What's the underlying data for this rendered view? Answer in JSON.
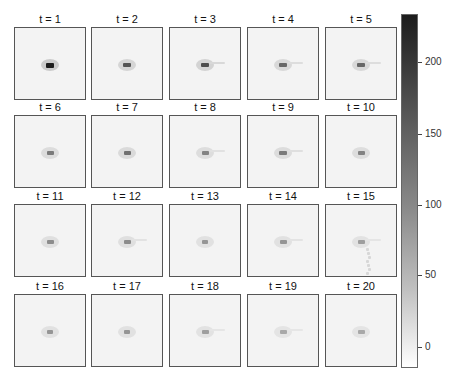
{
  "chart_data": {
    "type": "heatmap",
    "title": "",
    "layout": {
      "rows": 4,
      "cols": 5
    },
    "panels": [
      {
        "title": "t = 1",
        "peak": 230,
        "blob": {
          "cx": 35,
          "cy": 37,
          "w": 8,
          "h": 5
        },
        "trail": false
      },
      {
        "title": "t = 2",
        "peak": 170,
        "blob": {
          "cx": 35,
          "cy": 37,
          "w": 8,
          "h": 4
        },
        "trail": false
      },
      {
        "title": "t = 3",
        "peak": 180,
        "blob": {
          "cx": 35,
          "cy": 37,
          "w": 8,
          "h": 4
        },
        "trail": true
      },
      {
        "title": "t = 4",
        "peak": 150,
        "blob": {
          "cx": 35,
          "cy": 37,
          "w": 8,
          "h": 4
        },
        "trail": true
      },
      {
        "title": "t = 5",
        "peak": 150,
        "blob": {
          "cx": 35,
          "cy": 37,
          "w": 8,
          "h": 4
        },
        "trail": true
      },
      {
        "title": "t = 6",
        "peak": 130,
        "blob": {
          "cx": 35,
          "cy": 37,
          "w": 7,
          "h": 4
        },
        "trail": false
      },
      {
        "title": "t = 7",
        "peak": 140,
        "blob": {
          "cx": 35,
          "cy": 37,
          "w": 7,
          "h": 4
        },
        "trail": false
      },
      {
        "title": "t = 8",
        "peak": 120,
        "blob": {
          "cx": 35,
          "cy": 37,
          "w": 7,
          "h": 4
        },
        "trail": true
      },
      {
        "title": "t = 9",
        "peak": 130,
        "blob": {
          "cx": 35,
          "cy": 37,
          "w": 8,
          "h": 4
        },
        "trail": true
      },
      {
        "title": "t = 10",
        "peak": 120,
        "blob": {
          "cx": 35,
          "cy": 37,
          "w": 7,
          "h": 4
        },
        "trail": false
      },
      {
        "title": "t = 11",
        "peak": 110,
        "blob": {
          "cx": 35,
          "cy": 37,
          "w": 7,
          "h": 4
        },
        "trail": false
      },
      {
        "title": "t = 12",
        "peak": 110,
        "blob": {
          "cx": 35,
          "cy": 37,
          "w": 7,
          "h": 4
        },
        "trail": true
      },
      {
        "title": "t = 13",
        "peak": 100,
        "blob": {
          "cx": 35,
          "cy": 37,
          "w": 6,
          "h": 4
        },
        "trail": false
      },
      {
        "title": "t = 14",
        "peak": 100,
        "blob": {
          "cx": 35,
          "cy": 37,
          "w": 7,
          "h": 4
        },
        "trail": true
      },
      {
        "title": "t = 15",
        "peak": 90,
        "blob": {
          "cx": 35,
          "cy": 37,
          "w": 7,
          "h": 4
        },
        "trail": true
      },
      {
        "title": "t = 16",
        "peak": 100,
        "blob": {
          "cx": 35,
          "cy": 37,
          "w": 6,
          "h": 4
        },
        "trail": false
      },
      {
        "title": "t = 17",
        "peak": 100,
        "blob": {
          "cx": 35,
          "cy": 37,
          "w": 6,
          "h": 4
        },
        "trail": false
      },
      {
        "title": "t = 18",
        "peak": 90,
        "blob": {
          "cx": 35,
          "cy": 37,
          "w": 7,
          "h": 4
        },
        "trail": true
      },
      {
        "title": "t = 19",
        "peak": 80,
        "blob": {
          "cx": 35,
          "cy": 37,
          "w": 7,
          "h": 4
        },
        "trail": true
      },
      {
        "title": "t = 20",
        "peak": 80,
        "blob": {
          "cx": 35,
          "cy": 37,
          "w": 7,
          "h": 4
        },
        "trail": false
      }
    ],
    "colorbar": {
      "ticks": [
        200,
        150,
        100,
        50,
        0
      ],
      "range": [
        -15,
        235
      ],
      "colormap": "gray_r"
    }
  },
  "colorbar_labels": {
    "t200": "200",
    "t150": "150",
    "t100": "100",
    "t50": "50",
    "t0": "0"
  }
}
